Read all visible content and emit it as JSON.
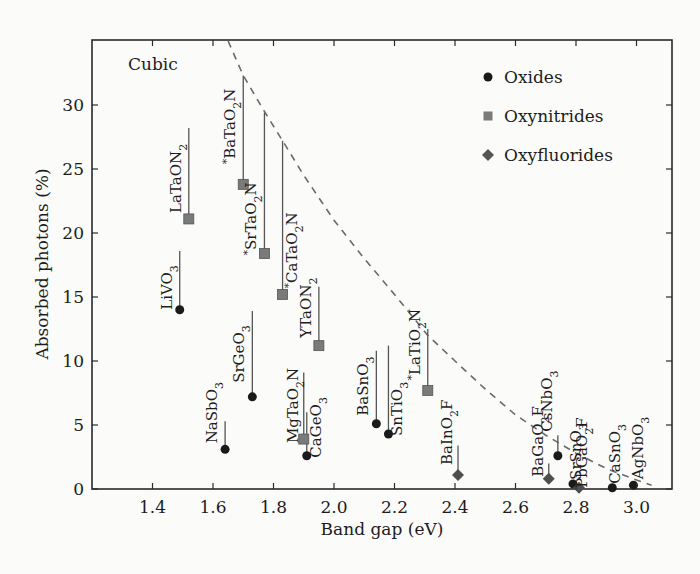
{
  "chart_data": {
    "type": "scatter",
    "title": "",
    "annotation": "Cubic",
    "xlabel": "Band gap (eV)",
    "ylabel": "Absorbed photons (%)",
    "xlim": [
      1.2,
      3.1
    ],
    "ylim": [
      0,
      35
    ],
    "xticks": [
      1.4,
      1.6,
      1.8,
      2.0,
      2.2,
      2.4,
      2.6,
      2.8,
      3.0
    ],
    "xtick_labels": [
      "1.4",
      "1.6",
      "1.8",
      "2.0",
      "2.2",
      "2.4",
      "2.6",
      "2.8",
      "3.0"
    ],
    "yticks": [
      0,
      5,
      10,
      15,
      20,
      25,
      30
    ],
    "ytick_labels": [
      "0",
      "5",
      "10",
      "15",
      "20",
      "25",
      "30"
    ],
    "grid": false,
    "legend_position": "upper right",
    "legend": [
      {
        "name": "Oxides",
        "marker": "circle",
        "color": "#1a1a1a"
      },
      {
        "name": "Oxynitrides",
        "marker": "square",
        "color": "#7a7a7a"
      },
      {
        "name": "Oxyfluorides",
        "marker": "diamond",
        "color": "#555555"
      }
    ],
    "series": [
      {
        "name": "Oxides",
        "points": [
          {
            "label": "LiVO3",
            "x": 1.49,
            "y": 14.0
          },
          {
            "label": "NaSbO3",
            "x": 1.64,
            "y": 3.1
          },
          {
            "label": "SrGeO3",
            "x": 1.73,
            "y": 7.2
          },
          {
            "label": "CaGeO3",
            "x": 1.91,
            "y": 2.6
          },
          {
            "label": "BaSnO3",
            "x": 2.14,
            "y": 5.1
          },
          {
            "label": "SnTiO3",
            "x": 2.18,
            "y": 4.3
          },
          {
            "label": "CsNbO3",
            "x": 2.74,
            "y": 2.6
          },
          {
            "label": "SrSnO3",
            "x": 2.79,
            "y": 0.4
          },
          {
            "label": "CaSnO3",
            "x": 2.92,
            "y": 0.1
          },
          {
            "label": "AgNbO3",
            "x": 2.99,
            "y": 0.3
          }
        ]
      },
      {
        "name": "Oxynitrides",
        "points": [
          {
            "label": "LaTaON2",
            "x": 1.52,
            "y": 21.1
          },
          {
            "label": "*BaTaO2N",
            "x": 1.7,
            "y": 23.8
          },
          {
            "label": "*SrTaO2N",
            "x": 1.77,
            "y": 18.4
          },
          {
            "label": "*CaTaO2N",
            "x": 1.83,
            "y": 15.2
          },
          {
            "label": "MgTaO2N",
            "x": 1.9,
            "y": 3.9
          },
          {
            "label": "YTaON2",
            "x": 1.95,
            "y": 11.2
          },
          {
            "label": "*LaTiO2N",
            "x": 2.31,
            "y": 7.7
          }
        ]
      },
      {
        "name": "Oxyfluorides",
        "points": [
          {
            "label": "BaInO2F",
            "x": 2.41,
            "y": 1.1
          },
          {
            "label": "BaGaO2F",
            "x": 2.71,
            "y": 0.8
          },
          {
            "label": "PbGaO2F",
            "x": 2.81,
            "y": 0.1
          }
        ]
      }
    ],
    "limit_curve": {
      "style": "dashed",
      "description": "theoretical maximum absorbed photons vs band gap",
      "x": [
        1.65,
        1.7,
        1.77,
        1.83,
        1.9,
        2.0,
        2.1,
        2.2,
        2.31,
        2.4,
        2.5,
        2.6,
        2.7,
        2.8,
        2.9,
        3.0,
        3.05
      ],
      "y": [
        35.0,
        32.3,
        29.5,
        27.2,
        24.5,
        21.0,
        18.0,
        15.2,
        12.0,
        10.0,
        7.8,
        5.8,
        4.2,
        2.8,
        1.6,
        0.7,
        0.3
      ]
    }
  }
}
